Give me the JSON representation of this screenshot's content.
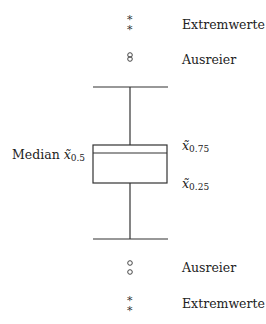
{
  "diagram": {
    "type": "boxplot-explanation",
    "labels": {
      "extreme_top": "Extremwerte",
      "outlier_top": "Ausreier",
      "median_word": "Median",
      "median_symbol": "x̃",
      "median_sub": "0.5",
      "q75_symbol": "x̃",
      "q75_sub": "0.75",
      "q25_symbol": "x̃",
      "q25_sub": "0.25",
      "outlier_bottom": "Ausreier",
      "extreme_bottom": "Extremwerte"
    },
    "markers": {
      "extreme": "*",
      "outlier": "○"
    },
    "line_color": "#333333"
  }
}
